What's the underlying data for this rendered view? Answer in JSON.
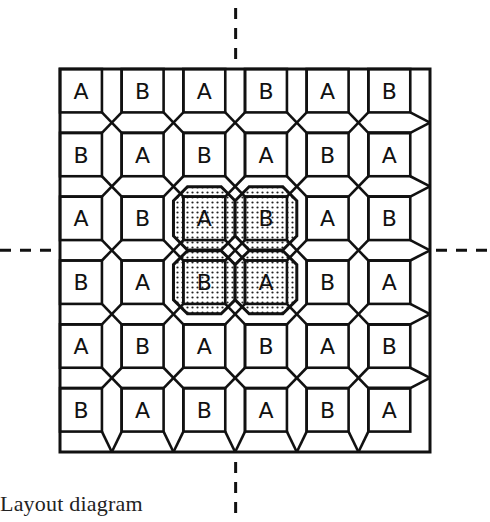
{
  "caption": "Layout diagram",
  "grid": {
    "rows": 6,
    "cols": 6,
    "letters": [
      [
        "A",
        "B",
        "A",
        "B",
        "A",
        "B"
      ],
      [
        "B",
        "A",
        "B",
        "A",
        "B",
        "A"
      ],
      [
        "A",
        "B",
        "A",
        "B",
        "A",
        "B"
      ],
      [
        "B",
        "A",
        "B",
        "A",
        "B",
        "A"
      ],
      [
        "A",
        "B",
        "A",
        "B",
        "A",
        "B"
      ],
      [
        "B",
        "A",
        "B",
        "A",
        "B",
        "A"
      ]
    ],
    "shaded_blocks": [
      [
        2,
        2
      ],
      [
        2,
        3
      ],
      [
        3,
        2
      ],
      [
        3,
        3
      ]
    ]
  },
  "guides": {
    "vertical_center_dashed": true,
    "horizontal_center_dashed": true
  },
  "colors": {
    "line": "#111111",
    "background": "#ffffff",
    "shade_dot": "#222222"
  }
}
